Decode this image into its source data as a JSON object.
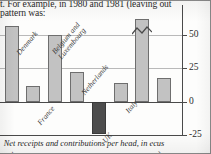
{
  "body_text": {
    "line1": "t. For example, in 1980 and 1981 (leaving out",
    "line2": "pattern was:"
  },
  "caption": "Net receipts and contributions per head, in ecus",
  "chart_data": {
    "type": "bar",
    "title": "",
    "subtitle": "",
    "xlabel": "",
    "ylabel": "",
    "categories": [
      "Germany",
      "Denmark",
      "France",
      "Belgium and Luxembourg",
      "Netherlands",
      "UK",
      "Italy",
      "Ireland",
      "Greece"
    ],
    "values": [
      -22,
      57,
      12,
      50,
      22,
      -24,
      14,
      90,
      18
    ],
    "value_notes": [
      "partially cropped at left edge of image",
      "",
      "",
      "",
      "",
      "highlighted dark fill",
      "",
      "bar is truncated: axis-break zigzag drawn across it, actual value exceeds plotted top",
      ""
    ],
    "ylim": [
      -25,
      62
    ],
    "yticks": [
      -25,
      0,
      25,
      50
    ],
    "ytick_labels": [
      "-25",
      "0",
      "25",
      "50"
    ],
    "grid": true,
    "grid_lines": [
      25,
      50
    ],
    "zero_line": true,
    "legend": "none",
    "axis_position": "right",
    "series": [
      {
        "name": "Net receipts and contributions per head, in ecus",
        "values": [
          -22,
          57,
          12,
          50,
          22,
          -24,
          14,
          90,
          18
        ]
      }
    ],
    "annotations": [
      {
        "type": "axis-break",
        "on": "Ireland",
        "shape": "zigzag"
      }
    ],
    "colors": {
      "bar_fill": "#c2c2c2",
      "bar_fill_highlight": "#4d4d4d",
      "bar_stroke": "#6e6e6e",
      "gridline": "#b9b9b9",
      "axis": "#4a4a4a",
      "text": "#2b2b2b",
      "background": "#fdfdfc"
    }
  }
}
